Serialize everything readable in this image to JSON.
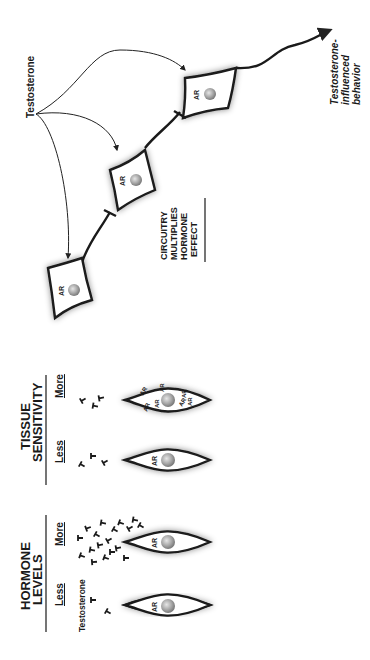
{
  "diagram": {
    "orientation": "rotated-90-ccw",
    "colors": {
      "ink": "#1a1a1a",
      "nucleus": "#9a9a9a",
      "background": "#ffffff"
    },
    "panel_hormone_levels": {
      "title_line1": "HORMONE",
      "title_line2": "LEVELS",
      "less_label": "Less",
      "more_label": "More",
      "molecule_label": "Testosterone",
      "cell_label": "AR",
      "less_molecule_count": 2,
      "more_molecule_count": 18
    },
    "panel_tissue_sensitivity": {
      "title_line1": "TISSUE",
      "title_line2": "SENSITIVITY",
      "less_label": "Less",
      "more_label": "More",
      "less_cell_label": "AR",
      "more_cell_labels": [
        "AR",
        "AR",
        "AR",
        "AR",
        "AR",
        "AR",
        "AR"
      ],
      "less_molecule_count": 3,
      "more_molecule_count": 3
    },
    "panel_circuitry": {
      "hormone_label": "Testosterone",
      "cell_label": "AR",
      "cell_count": 3,
      "caption_line1": "CIRCUITRY",
      "caption_line2": "MULTIPLIES",
      "caption_line3": "HORMONE",
      "caption_line4": "EFFECT",
      "output_line1": "Testosterone-",
      "output_line2": "influenced",
      "output_line3": "behavior"
    }
  }
}
